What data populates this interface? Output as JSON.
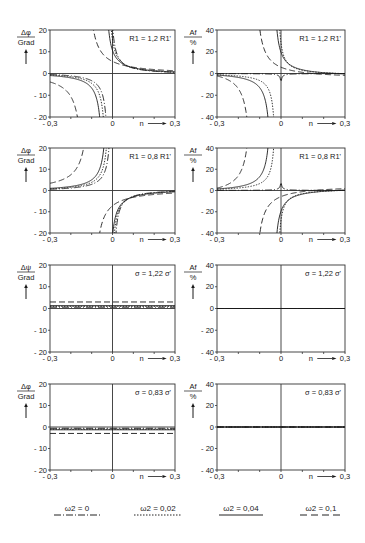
{
  "chart_data": [
    {
      "id": "p1",
      "row": 1,
      "col": 1,
      "type": "line",
      "ylabel": "Δφ / Grad",
      "xlabel": "n",
      "annotation": "R1 = 1,2 R1'",
      "xlim": [
        -0.3,
        0.3
      ],
      "ylim": [
        -20,
        20
      ],
      "xticks": [
        "-0,3",
        "0",
        "0,3"
      ],
      "yticks": [
        "20",
        "10",
        "0",
        "-10",
        "-20"
      ],
      "series": [
        {
          "name": "ω2 = 0",
          "style": "dashdot",
          "kind": "pole",
          "pole": -0.015,
          "left": 0.8,
          "right": -0.6,
          "k": 0.35
        },
        {
          "name": "ω2 = 0,02",
          "style": "dotted",
          "kind": "pole",
          "pole": -0.025,
          "left": 0.8,
          "right": -0.6,
          "k": 0.4
        },
        {
          "name": "ω2 = 0,04",
          "style": "solid",
          "kind": "pole",
          "pole": -0.04,
          "left": 0.8,
          "right": -0.6,
          "k": 0.45
        },
        {
          "name": "ω2 = 0,1",
          "style": "dashed",
          "kind": "pole",
          "pole": -0.13,
          "left": 0.8,
          "right": -0.6,
          "k": 0.8
        }
      ]
    },
    {
      "id": "p2",
      "row": 1,
      "col": 2,
      "type": "line",
      "ylabel": "Af / %",
      "xlabel": "n",
      "annotation": "R1 = 1,2 R1'",
      "xlim": [
        -0.3,
        0.3
      ],
      "ylim": [
        -40,
        40
      ],
      "xticks": [
        "-0,3",
        "0",
        "0,3"
      ],
      "yticks": [
        "40",
        "20",
        "0",
        "-20",
        "-40"
      ],
      "series": [
        {
          "name": "ω2 = 0",
          "style": "dashdot",
          "kind": "pole",
          "pole": 0.0,
          "left": 0.5,
          "right": -0.5,
          "k": 0.02,
          "dip": true
        },
        {
          "name": "ω2 = 0,02",
          "style": "dotted",
          "kind": "pole",
          "pole": -0.02,
          "left": 1.0,
          "right": -2.0,
          "k": 0.6
        },
        {
          "name": "ω2 = 0,04",
          "style": "solid",
          "kind": "pole",
          "pole": -0.04,
          "left": 2.0,
          "right": -3.0,
          "k": 0.9
        },
        {
          "name": "ω2 = 0,1",
          "style": "dashed",
          "kind": "pole",
          "pole": -0.13,
          "left": 6.0,
          "right": -5.0,
          "k": 1.4
        }
      ]
    },
    {
      "id": "p3",
      "row": 2,
      "col": 1,
      "type": "line",
      "ylabel": "Δφ / Grad",
      "xlabel": "n",
      "annotation": "R1 = 0,8 R1'",
      "xlim": [
        -0.3,
        0.3
      ],
      "ylim": [
        -20,
        20
      ],
      "xticks": [
        "-0,3",
        "0",
        "0,3"
      ],
      "yticks": [
        "20",
        "10",
        "0",
        "-10",
        "-20"
      ],
      "series": [
        {
          "name": "ω2 = 0",
          "style": "dashdot",
          "kind": "pole",
          "pole": 0.0,
          "left": -0.6,
          "right": 0.8,
          "k": -0.35
        },
        {
          "name": "ω2 = 0,02",
          "style": "dotted",
          "kind": "pole",
          "pole": -0.01,
          "left": -0.6,
          "right": 0.8,
          "k": -0.4
        },
        {
          "name": "ω2 = 0,04",
          "style": "solid",
          "kind": "pole",
          "pole": -0.02,
          "left": -0.6,
          "right": 0.8,
          "k": -0.45
        },
        {
          "name": "ω2 = 0,1",
          "style": "dashed",
          "kind": "pole",
          "pole": -0.1,
          "left": -0.6,
          "right": 0.8,
          "k": -0.8
        }
      ]
    },
    {
      "id": "p4",
      "row": 2,
      "col": 2,
      "type": "line",
      "ylabel": "Af / %",
      "xlabel": "n",
      "annotation": "R1 = 0,8 R1'",
      "xlim": [
        -0.3,
        0.3
      ],
      "ylim": [
        -40,
        40
      ],
      "xticks": [
        "-0,3",
        "0",
        "0,3"
      ],
      "yticks": [
        "40",
        "20",
        "0",
        "-20",
        "-40"
      ],
      "series": [
        {
          "name": "ω2 = 0",
          "style": "dashdot",
          "kind": "pole",
          "pole": 0.0,
          "left": -0.5,
          "right": 0.5,
          "k": -0.02,
          "dip": true
        },
        {
          "name": "ω2 = 0,02",
          "style": "dotted",
          "kind": "pole",
          "pole": -0.02,
          "left": -1.0,
          "right": 2.0,
          "k": -0.6
        },
        {
          "name": "ω2 = 0,04",
          "style": "solid",
          "kind": "pole",
          "pole": -0.04,
          "left": -2.0,
          "right": 3.0,
          "k": -0.9
        },
        {
          "name": "ω2 = 0,1",
          "style": "dashed",
          "kind": "pole",
          "pole": -0.13,
          "left": -6.0,
          "right": 5.0,
          "k": -1.4
        }
      ]
    },
    {
      "id": "p5",
      "row": 3,
      "col": 1,
      "type": "line",
      "ylabel": "Δψ / Grad",
      "xlabel": "n",
      "annotation": "σ = 1,22 σ'",
      "xlim": [
        -0.3,
        0.3
      ],
      "ylim": [
        -20,
        20
      ],
      "xticks": [
        "-0,3",
        "0",
        "0,3"
      ],
      "yticks": [
        "20",
        "10",
        "0",
        "-10",
        "-20"
      ],
      "series": [
        {
          "name": "ω2 = 0",
          "style": "dashdot",
          "kind": "const",
          "value": 0.6
        },
        {
          "name": "ω2 = 0,02",
          "style": "dotted",
          "kind": "const",
          "value": 1.0
        },
        {
          "name": "ω2 = 0,04",
          "style": "solid",
          "kind": "const",
          "value": 1.3
        },
        {
          "name": "ω2 = 0,1",
          "style": "dashed",
          "kind": "const",
          "value": 3.0
        }
      ]
    },
    {
      "id": "p6",
      "row": 3,
      "col": 2,
      "type": "line",
      "ylabel": "Af / %",
      "xlabel": "n",
      "annotation": "σ = 1,22 σ'",
      "xlim": [
        -0.3,
        0.3
      ],
      "ylim": [
        -40,
        40
      ],
      "xticks": [
        "-0,3",
        "0",
        "0,3"
      ],
      "yticks": [
        "40",
        "20",
        "0",
        "-20",
        "-40"
      ],
      "series": [
        {
          "name": "ω2 = 0",
          "style": "dashdot",
          "kind": "const",
          "value": 0
        },
        {
          "name": "ω2 = 0,02",
          "style": "dotted",
          "kind": "const",
          "value": 0
        },
        {
          "name": "ω2 = 0,04",
          "style": "solid",
          "kind": "const",
          "value": 0
        },
        {
          "name": "ω2 = 0,1",
          "style": "dashed",
          "kind": "const",
          "value": 0
        }
      ]
    },
    {
      "id": "p7",
      "row": 4,
      "col": 1,
      "type": "line",
      "ylabel": "Δφ / Grad",
      "xlabel": "n",
      "annotation": "σ = 0,83 σ'",
      "xlim": [
        -0.3,
        0.3
      ],
      "ylim": [
        -20,
        20
      ],
      "xticks": [
        "-0,3",
        "0",
        "0,3"
      ],
      "yticks": [
        "20",
        "10",
        "0",
        "-10",
        "-20"
      ],
      "series": [
        {
          "name": "ω2 = 0",
          "style": "dashdot",
          "kind": "const",
          "value": -0.6
        },
        {
          "name": "ω2 = 0,02",
          "style": "dotted",
          "kind": "const",
          "value": -1.0
        },
        {
          "name": "ω2 = 0,04",
          "style": "solid",
          "kind": "const",
          "value": -1.3
        },
        {
          "name": "ω2 = 0,1",
          "style": "dashed",
          "kind": "const",
          "value": -3.0
        }
      ]
    },
    {
      "id": "p8",
      "row": 4,
      "col": 2,
      "type": "line",
      "ylabel": "Af / %",
      "xlabel": "n",
      "annotation": "σ = 0,83 σ'",
      "xlim": [
        -0.3,
        0.3
      ],
      "ylim": [
        -40,
        40
      ],
      "xticks": [
        "-0,3",
        "0",
        "0,3"
      ],
      "yticks": [
        "40",
        "20",
        "0",
        "-20",
        "-40"
      ],
      "series": [
        {
          "name": "ω2 = 0",
          "style": "dashdot",
          "kind": "const",
          "value": 0
        },
        {
          "name": "ω2 = 0,02",
          "style": "dotted",
          "kind": "const",
          "value": 0
        },
        {
          "name": "ω2 = 0,04",
          "style": "solid",
          "kind": "const",
          "value": 0
        },
        {
          "name": "ω2 = 0,1",
          "style": "dashed",
          "kind": "const",
          "value": 0
        }
      ]
    }
  ],
  "legend": [
    {
      "label": "ω2 = 0",
      "style": "dashdot"
    },
    {
      "label": "ω2 = 0,02",
      "style": "dotted"
    },
    {
      "label": "ω2 = 0,04",
      "style": "solid"
    },
    {
      "label": "ω2 = 0,1",
      "style": "dashed"
    }
  ],
  "layout": {
    "cols_x": [
      [
        50,
        175
      ],
      [
        217,
        345
      ]
    ],
    "rows_y": [
      [
        30,
        117
      ],
      [
        148,
        233
      ],
      [
        265,
        352
      ],
      [
        384,
        470
      ]
    ],
    "ink": "#1a1a1a",
    "axis_ink": "#333333"
  }
}
